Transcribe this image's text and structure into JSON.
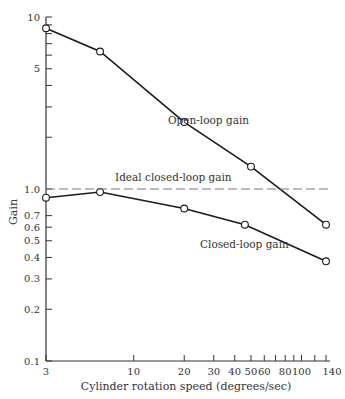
{
  "chart_data": {
    "type": "line",
    "title": "",
    "xlabel": "Cylinder rotation speed (degrees/sec)",
    "ylabel": "Gain",
    "xscale": "log",
    "yscale": "log",
    "xlim": [
      3,
      140
    ],
    "ylim": [
      0.1,
      10
    ],
    "grid": false,
    "legend": "none (inline annotations)",
    "x_ticks": [
      3,
      10,
      20,
      30,
      40,
      50,
      60,
      70,
      80,
      90,
      100,
      120,
      140
    ],
    "x_tick_labels": [
      {
        "value": 3,
        "label": "3"
      },
      {
        "value": 10,
        "label": "10"
      },
      {
        "value": 20,
        "label": "20"
      },
      {
        "value": 30,
        "label": "30"
      },
      {
        "value": 40,
        "label": "40"
      },
      {
        "value": 50,
        "label": "50"
      },
      {
        "value": 60,
        "label": "60"
      },
      {
        "value": 80,
        "label": "80"
      },
      {
        "value": 100,
        "label": "100"
      },
      {
        "value": 140,
        "label": "140"
      }
    ],
    "y_ticks": [
      0.1,
      0.2,
      0.3,
      0.4,
      0.5,
      0.6,
      0.7,
      1.0,
      2,
      3,
      4,
      5,
      6,
      7,
      8,
      9,
      10
    ],
    "y_tick_labels": [
      {
        "value": 0.1,
        "label": "0.1"
      },
      {
        "value": 0.2,
        "label": "0.2"
      },
      {
        "value": 0.3,
        "label": "0.3"
      },
      {
        "value": 0.4,
        "label": "0.4"
      },
      {
        "value": 0.5,
        "label": "0.5"
      },
      {
        "value": 0.6,
        "label": "0.6"
      },
      {
        "value": 0.7,
        "label": "0.7"
      },
      {
        "value": 1.0,
        "label": "1.0"
      },
      {
        "value": 5,
        "label": "5"
      },
      {
        "value": 10,
        "label": "10"
      }
    ],
    "series": [
      {
        "name": "Open-loop gain",
        "style": "solid line, open circle markers",
        "x": [
          3,
          6.3,
          20,
          50,
          140
        ],
        "y": [
          8.6,
          6.3,
          2.45,
          1.35,
          0.62
        ]
      },
      {
        "name": "Closed-loop gain",
        "style": "solid line, open circle markers",
        "x": [
          3,
          6.3,
          20,
          46,
          140
        ],
        "y": [
          0.89,
          0.96,
          0.77,
          0.62,
          0.38
        ]
      },
      {
        "name": "Ideal closed-loop gain",
        "style": "dashed horizontal line",
        "x": [
          3,
          140
        ],
        "y": [
          1.0,
          1.0
        ]
      }
    ],
    "annotations": [
      {
        "text": "Open-loop gain",
        "x": 36,
        "y": 3.0
      },
      {
        "text": "Ideal closed-loop gain",
        "x": 9,
        "y": 1.1
      },
      {
        "text": "Closed-loop gain",
        "x": 46,
        "y": 0.47
      }
    ]
  },
  "labels": {
    "xlabel": "Cylinder rotation speed (degrees/sec)",
    "ylabel": "Gain",
    "open_loop": "Open-loop gain",
    "ideal": "Ideal closed-loop gain",
    "closed_loop": "Closed-loop gain"
  },
  "colors": {
    "line": "#1a1a1a",
    "dash": "#7a7a7a",
    "axis": "#333333",
    "text": "#333333"
  }
}
